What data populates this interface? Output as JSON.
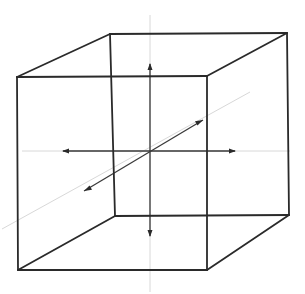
{
  "diagram": {
    "type": "wireframe-cube-with-axes",
    "colors": {
      "edge": "#2a2a2a",
      "axis": "#3a3a3a",
      "axis_faint": "#d8d8d8",
      "background": "#ffffff"
    },
    "cube": {
      "front_face": {
        "top_left": [
          17,
          77
        ],
        "top_right": [
          207,
          76
        ],
        "bottom_right": [
          207,
          270
        ],
        "bottom_left": [
          18,
          270
        ]
      },
      "back_face": {
        "top_left": [
          110,
          34
        ],
        "top_right": [
          287,
          33
        ],
        "bottom_right": [
          289,
          215
        ],
        "bottom_left": [
          115,
          216
        ]
      }
    },
    "origin": [
      150,
      151
    ],
    "axes": [
      {
        "name": "vertical",
        "from": [
          150,
          15
        ],
        "to": [
          150,
          292
        ],
        "arrows": [
          [
            150,
            67,
            "up"
          ],
          [
            150,
            233,
            "down"
          ]
        ]
      },
      {
        "name": "horizontal",
        "from": [
          22,
          151
        ],
        "to": [
          290,
          151
        ],
        "arrows": [
          [
            66,
            151,
            "left"
          ],
          [
            232,
            151,
            "right"
          ]
        ]
      },
      {
        "name": "depth",
        "from": [
          2,
          229
        ],
        "to": [
          250,
          92
        ],
        "arrows": [
          [
            88,
            189,
            "down-left"
          ],
          [
            199,
            122,
            "up-right"
          ]
        ]
      }
    ]
  }
}
